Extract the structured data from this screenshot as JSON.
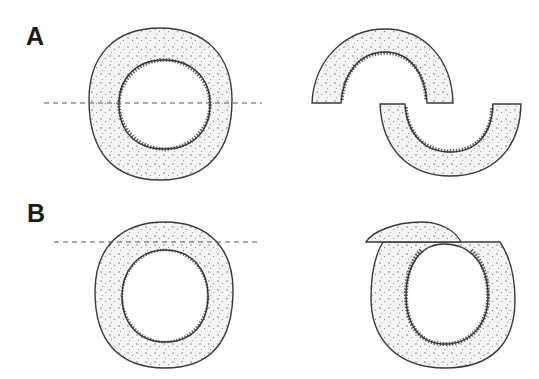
{
  "figure": {
    "panels": [
      {
        "label": "A",
        "description": "Horizontal section through the middle of a ring: cut line passes through the lumen, producing two separated C-shaped halves (upper and lower arcs)."
      },
      {
        "label": "B",
        "description": "Tangential section near the top of a ring: cut line passes only through the wall, removing a small cap while leaving the ring largely intact."
      }
    ],
    "colors": {
      "outline": "#3a3a3a",
      "fill": "#f2f2f2",
      "stipple": "#555555",
      "inner_rim": "#2e2e2e",
      "cut_line": "#555555"
    }
  }
}
